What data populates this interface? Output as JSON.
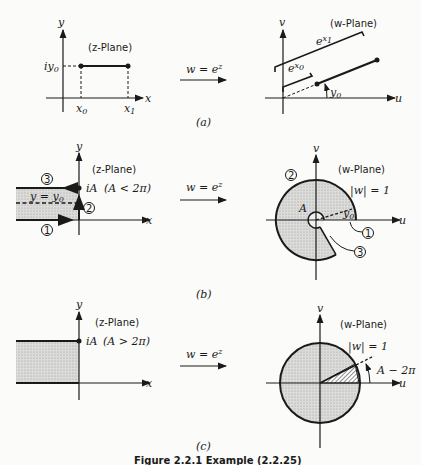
{
  "mapping_label": "w = e^z",
  "panels": [
    {
      "id": "a",
      "label": "(a)",
      "z_plane": {
        "title": "(z-Plane)",
        "x_axis": "x",
        "y_axis": "y",
        "y_tick": "iy0",
        "x_ticks": [
          "x0",
          "x1"
        ]
      },
      "w_plane": {
        "title": "(w-Plane)",
        "u_axis": "u",
        "v_axis": "v",
        "brace_outer": "e^x1",
        "brace_inner": "e^x0",
        "angle": "y0"
      }
    },
    {
      "id": "b",
      "label": "(b)",
      "z_plane": {
        "title": "(z-Plane)",
        "x_axis": "x",
        "y_axis": "y",
        "point": "iA",
        "condition": "(A < 2π)",
        "dashed_line": "y = y0",
        "paths": [
          "1",
          "2",
          "3"
        ]
      },
      "w_plane": {
        "title": "(w-Plane)",
        "u_axis": "u",
        "v_axis": "v",
        "circle": "|w| = 1",
        "angle_A": "A",
        "angle_y0": "y0",
        "paths": [
          "1",
          "2",
          "3"
        ]
      }
    },
    {
      "id": "c",
      "label": "(c)",
      "z_plane": {
        "title": "(z-Plane)",
        "x_axis": "x",
        "y_axis": "y",
        "point": "iA",
        "condition": "(A > 2π)"
      },
      "w_plane": {
        "title": "(w-Plane)",
        "u_axis": "u",
        "v_axis": "v",
        "circle": "|w| = 1",
        "angle": "A − 2π"
      }
    }
  ],
  "caption": "Figure 2.2.1   Example (2.2.25)",
  "colors": {
    "ink": "#1a1a1a",
    "shade": "#d4d4d2",
    "paper": "#fbfbf9"
  }
}
